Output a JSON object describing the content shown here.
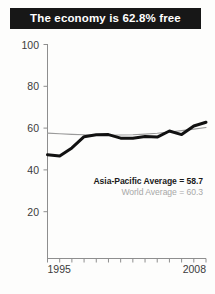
{
  "title": {
    "text": "The economy is 62.8% free"
  },
  "legend": {
    "asia_label": "Asia-Pacific Average = 58.7",
    "world_label": "World Average = 60.3"
  },
  "colors": {
    "banner_background": "#171717",
    "banner_text": "#ffffff",
    "asia_line": "#111111",
    "world_line": "#9a9a9a",
    "axis": "#8e8e8e",
    "tick_text": "#3b3b3b",
    "legend_world_text": "#a8a8a8",
    "page_background": "#fdfdfc"
  },
  "chart_data": {
    "type": "line",
    "title": "The economy is 62.8% free",
    "xlabel": "",
    "ylabel": "",
    "xlim": [
      1995,
      2008
    ],
    "ylim": [
      0,
      100
    ],
    "ytick_labels": [
      "100",
      "80",
      "60",
      "40",
      "20"
    ],
    "ytick_values": [
      100,
      80,
      60,
      40,
      20
    ],
    "xtick_labels": [
      "1995",
      "2008"
    ],
    "xtick_values": [
      1995,
      2008
    ],
    "x_minor_ticks": [
      1995,
      1996,
      1997,
      1998,
      1999,
      2000,
      2001,
      2002,
      2003,
      2004,
      2005,
      2006,
      2007,
      2008
    ],
    "grid": false,
    "legend_position": "inside-lower-right",
    "x": [
      1995,
      1996,
      1997,
      1998,
      1999,
      2000,
      2001,
      2002,
      2003,
      2004,
      2005,
      2006,
      2007,
      2008
    ],
    "series": [
      {
        "name": "Asia-Pacific Average = 58.7",
        "color": "#111111",
        "linewidth": 3.0,
        "average": 58.7,
        "final_value": 62.8,
        "values": [
          47.3,
          46.6,
          50.5,
          55.9,
          56.8,
          56.9,
          55.2,
          55.1,
          56.0,
          55.7,
          58.6,
          56.9,
          61.0,
          62.8
        ]
      },
      {
        "name": "World Average = 60.3",
        "color": "#9a9a9a",
        "linewidth": 1.1,
        "average": 60.3,
        "final_value": 60.3,
        "values": [
          57.6,
          57.3,
          57.0,
          56.8,
          56.6,
          56.6,
          56.7,
          56.8,
          57.1,
          57.5,
          58.1,
          58.8,
          59.5,
          60.3
        ]
      }
    ]
  }
}
